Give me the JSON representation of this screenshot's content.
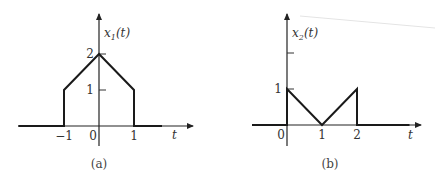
{
  "figure": {
    "panels": [
      {
        "id": "a",
        "caption": "(a)",
        "signal_label_base": "x",
        "signal_label_sub": "1",
        "signal_label_arg": "(t)",
        "x_axis_label": "t",
        "x_ticks": [
          "-1",
          "0",
          "1"
        ],
        "x_tick_values": [
          -1,
          0,
          1
        ],
        "y_ticks": [
          "1",
          "2"
        ],
        "y_tick_values": [
          1,
          2
        ],
        "points": [
          [
            -2.3,
            0
          ],
          [
            -1,
            0
          ],
          [
            -1,
            1
          ],
          [
            0,
            2
          ],
          [
            1,
            1
          ],
          [
            1,
            0
          ],
          [
            1.8,
            0
          ]
        ],
        "description": "Trapezoid-like pulse: 0 for t<-1, jumps to 1 at t=-1, rises linearly to 2 at t=0, falls linearly to 1 at t=1, drops to 0 for t>1"
      },
      {
        "id": "b",
        "caption": "(b)",
        "signal_label_base": "x",
        "signal_label_sub": "2",
        "signal_label_arg": "(t)",
        "x_axis_label": "t",
        "x_ticks": [
          "0",
          "1",
          "2"
        ],
        "x_tick_values": [
          0,
          1,
          2
        ],
        "y_ticks": [
          "1",
          ""
        ],
        "y_tick_values": [
          1,
          2
        ],
        "points": [
          [
            -1,
            0
          ],
          [
            0,
            0
          ],
          [
            0,
            1
          ],
          [
            1,
            0
          ],
          [
            2,
            1
          ],
          [
            2,
            0
          ],
          [
            3.5,
            0
          ]
        ],
        "description": "V-shaped signal: jumps to 1 at t=0, decreases linearly to 0 at t=1, increases linearly to 1 at t=2, drops to 0 for t>2"
      }
    ]
  }
}
